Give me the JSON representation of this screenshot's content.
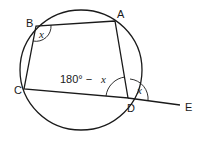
{
  "diagram": {
    "points": {
      "A": {
        "label": "A",
        "x": 115,
        "y": 21
      },
      "B": {
        "label": "B",
        "x": 36,
        "y": 26
      },
      "C": {
        "label": "C",
        "x": 24,
        "y": 89
      },
      "D": {
        "label": "D",
        "x": 128,
        "y": 98
      },
      "E": {
        "label": "E",
        "x": 180,
        "y": 105
      }
    },
    "angles": {
      "B": {
        "label": "x"
      },
      "ADC": {
        "label_num": "180° − ",
        "label_var": "x"
      },
      "ADE": {
        "label": "x"
      }
    },
    "colors": {
      "stroke": "#1a1a1a",
      "background": "#ffffff"
    }
  }
}
